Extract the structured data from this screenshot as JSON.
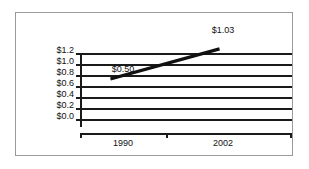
{
  "chart_data": {
    "type": "line",
    "title": "",
    "subtitle": "",
    "xlabel": "",
    "ylabel": "",
    "x": [
      "1990",
      "2002"
    ],
    "categories": [
      "1990",
      "2002"
    ],
    "values": [
      0.5,
      1.03
    ],
    "series": [
      {
        "name": "",
        "values": [
          0.5,
          1.03
        ]
      }
    ],
    "point_labels": [
      "$0.50",
      "$1.03"
    ],
    "ylim": [
      0.0,
      1.2
    ],
    "ytick_values": [
      1.2,
      1.0,
      0.8,
      0.6,
      0.4,
      0.2,
      0.0
    ],
    "ytick_labels": [
      "$1.2",
      "$1.0",
      "$0.8",
      "$0.6",
      "$0.4",
      "$0.2",
      "$0.0"
    ],
    "xtick_labels": [
      "1990",
      "2002"
    ],
    "grid": true,
    "grid_orientation": "horizontal",
    "legend": false,
    "legend_position": "none",
    "line_color": "#111111",
    "grid_color": "#1a1a1a",
    "frame_color": "#9a9a9a",
    "background_color": "#ffffff"
  },
  "axis": {
    "y_labels": [
      {
        "text": "$1.2",
        "value": 1.2
      },
      {
        "text": "$1.0",
        "value": 1.0
      },
      {
        "text": "$0.8",
        "value": 0.8
      },
      {
        "text": "$0.6",
        "value": 0.6
      },
      {
        "text": "$0.4",
        "value": 0.4
      },
      {
        "text": "$0.2",
        "value": 0.2
      },
      {
        "text": "$0.0",
        "value": 0.0
      }
    ],
    "x_labels": [
      {
        "text": "1990"
      },
      {
        "text": "2002"
      }
    ]
  },
  "annotations": [
    {
      "text": "$0.50"
    },
    {
      "text": "$1.03"
    }
  ]
}
